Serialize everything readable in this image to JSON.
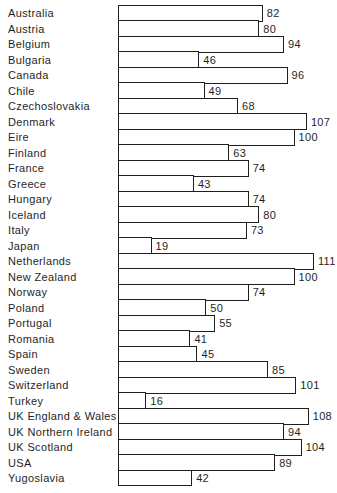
{
  "chart_data": {
    "type": "bar",
    "orientation": "horizontal",
    "title": "",
    "xlabel": "",
    "ylabel": "",
    "xlim": [
      0,
      115
    ],
    "grid": false,
    "legend": false,
    "value_labels_shown": true,
    "bar_fill_color": "#ffffff",
    "bar_border_color": "#1f1f1f",
    "text_color": "#1f1f1f",
    "background_color": "#ffffff",
    "categories": [
      "Australia",
      "Austria",
      "Belgium",
      "Bulgaria",
      "Canada",
      "Chile",
      "Czechoslovakia",
      "Denmark",
      "Eire",
      "Finland",
      "France",
      "Greece",
      "Hungary",
      "Iceland",
      "Italy",
      "Japan",
      "Netherlands",
      "New Zealand",
      "Norway",
      "Poland",
      "Portugal",
      "Romania",
      "Spain",
      "Sweden",
      "Switzerland",
      "Turkey",
      "UK England & Wales",
      "UK Northern Ireland",
      "UK Scotland",
      "USA",
      "Yugoslavia"
    ],
    "values": [
      82,
      80,
      94,
      46,
      96,
      49,
      68,
      107,
      100,
      63,
      74,
      43,
      74,
      80,
      73,
      19,
      111,
      100,
      74,
      50,
      55,
      41,
      45,
      85,
      101,
      16,
      108,
      94,
      104,
      89,
      42
    ]
  }
}
